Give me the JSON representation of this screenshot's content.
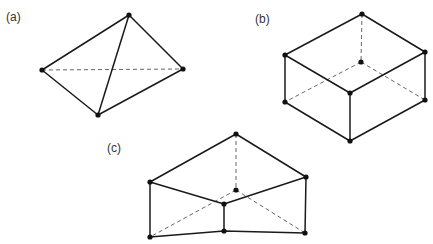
{
  "labels": {
    "a": "(a)",
    "b": "(b)",
    "c": "(c)"
  },
  "figures": {
    "a": {
      "name": "tetrahedron",
      "vertices": [
        [
          129,
          15
        ],
        [
          42,
          70
        ],
        [
          183,
          69
        ],
        [
          98,
          115
        ]
      ]
    },
    "b": {
      "name": "hexahedron",
      "vertices": [
        [
          362,
          14
        ],
        [
          285,
          55
        ],
        [
          425,
          52
        ],
        [
          350,
          93
        ],
        [
          361,
          62
        ],
        [
          285,
          102
        ],
        [
          425,
          100
        ],
        [
          350,
          141
        ]
      ]
    },
    "c": {
      "name": "triangular-prism-wedge",
      "vertices": [
        [
          236,
          134
        ],
        [
          150,
          182
        ],
        [
          306,
          177
        ],
        [
          224,
          204
        ],
        [
          236,
          190
        ],
        [
          150,
          237
        ],
        [
          224,
          231
        ],
        [
          305,
          233
        ]
      ]
    }
  },
  "style": {
    "line_color": "#1a1a1a",
    "hidden_color": "#555555"
  }
}
